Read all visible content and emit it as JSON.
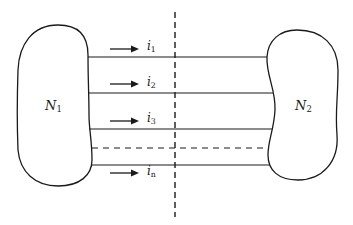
{
  "diagram": {
    "networks": [
      {
        "id": "N1",
        "label_main": "N",
        "label_sub": "1"
      },
      {
        "id": "N2",
        "label_main": "N",
        "label_sub": "2"
      }
    ],
    "currents": [
      {
        "label_main": "i",
        "label_sub": "1"
      },
      {
        "label_main": "i",
        "label_sub": "2"
      },
      {
        "label_main": "i",
        "label_sub": "3"
      },
      {
        "label_main": "i",
        "label_sub": "n"
      }
    ],
    "colors": {
      "stroke": "#1a1a1a",
      "background": "#ffffff"
    }
  }
}
